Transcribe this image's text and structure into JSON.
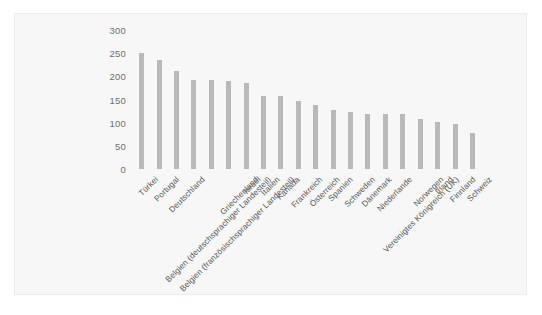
{
  "chart_data": {
    "type": "bar",
    "title": "",
    "subtitle": "",
    "xlabel": "",
    "ylabel": "",
    "ylim": [
      0,
      300
    ],
    "yticks": [
      300,
      250,
      200,
      150,
      100,
      50,
      0
    ],
    "grid": false,
    "legend": null,
    "bar_color": "#b9b9b9",
    "background_color": "#f7f7f7",
    "categories": [
      "Türkei",
      "Portugal",
      "Deutschland",
      "Belgien (deutschsprachiger Landesteil)",
      "Belgien (französischsprachiger Landesteil)",
      "Griechenland",
      "Israel",
      "Italien",
      "Kanada",
      "Frankreich",
      "Österreich",
      "Spanien",
      "Schweden",
      "Dänemark",
      "Niederlande",
      "Vereinigtes Königreich (UK)",
      "Norwegen",
      "Irland",
      "Finnland",
      "Schweiz"
    ],
    "values": [
      250,
      235,
      211,
      192,
      192,
      189,
      185,
      158,
      157,
      147,
      138,
      128,
      123,
      119,
      119,
      118,
      108,
      101,
      97,
      78
    ]
  }
}
